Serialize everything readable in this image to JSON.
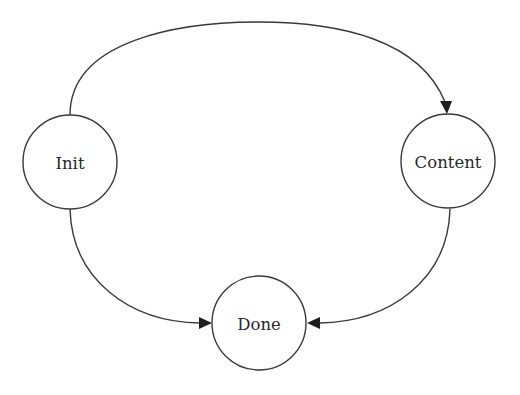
{
  "diagram": {
    "type": "state-transition",
    "nodes": [
      {
        "id": "init",
        "label": "Init",
        "cx": 70,
        "cy": 162,
        "r": 47
      },
      {
        "id": "content",
        "label": "Content",
        "cx": 448,
        "cy": 161,
        "r": 47
      },
      {
        "id": "done",
        "label": "Done",
        "cx": 259,
        "cy": 323,
        "r": 47
      }
    ],
    "edges": [
      {
        "from": "init",
        "to": "content",
        "label": ""
      },
      {
        "from": "init",
        "to": "done",
        "label": ""
      },
      {
        "from": "content",
        "to": "done",
        "label": ""
      }
    ],
    "colors": {
      "stroke": "#3a3a3a",
      "arrow": "#1e1e1e",
      "background": "#ffffff"
    }
  }
}
